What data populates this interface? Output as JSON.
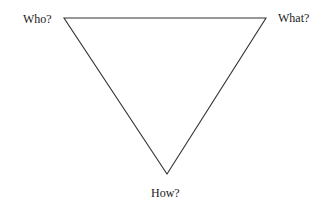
{
  "diagram": {
    "type": "triangle",
    "orientation": "inverted",
    "stroke_color": "#333333",
    "background": "#ffffff",
    "vertices": {
      "top_left": {
        "label": "Who?",
        "x": 64,
        "y": 18
      },
      "top_right": {
        "label": "What?",
        "x": 266,
        "y": 18
      },
      "bottom": {
        "label": "How?",
        "x": 167,
        "y": 174
      }
    }
  }
}
